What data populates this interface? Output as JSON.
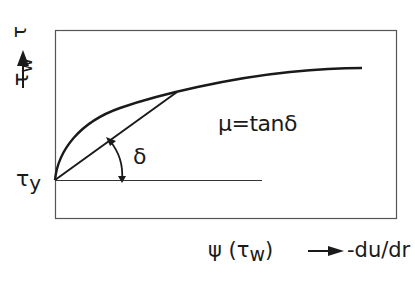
{
  "diagram": {
    "y_axis": {
      "label_main": "τ",
      "label_sub": "w",
      "arrow": "up-arrow",
      "origin_label_main": "τ",
      "origin_label_sub": "y"
    },
    "x_axis": {
      "label_prefix": "ψ (τ",
      "label_sub": "w",
      "label_suffix": ")",
      "arrow": "right-arrow",
      "label_target": "-du/dr"
    },
    "angle_label": "δ",
    "equation": "μ=tanδ",
    "colors": {
      "line": "#1a1a1a",
      "frame": "#555555",
      "background": "#ffffff"
    }
  }
}
